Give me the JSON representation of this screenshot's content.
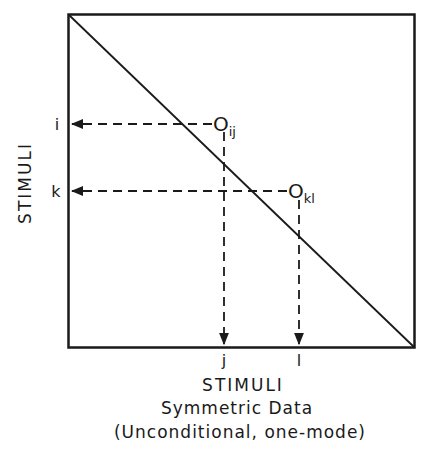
{
  "diagram": {
    "y_axis_label": "STIMULI",
    "x_axis_label": "STIMULI",
    "caption_line1": "Symmetric Data",
    "caption_line2": "(Unconditional, one-mode)",
    "row_labels": {
      "i": "i",
      "k": "k"
    },
    "col_labels": {
      "j": "j",
      "l": "l"
    },
    "points": [
      {
        "base": "O",
        "sub": "ij",
        "row": "i",
        "col": "j"
      },
      {
        "base": "O",
        "sub": "kl",
        "row": "k",
        "col": "l"
      }
    ],
    "line_color": "#1a1a1a",
    "background": "#ffffff"
  }
}
